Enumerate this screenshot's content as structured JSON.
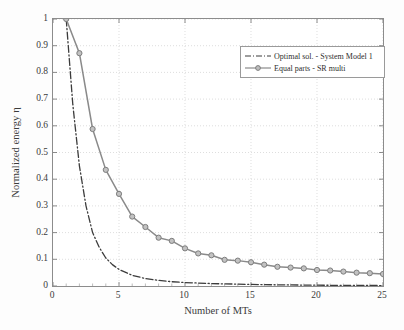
{
  "chart_data": {
    "type": "line",
    "title": "",
    "xlabel": "Number of MTs",
    "ylabel": "Normalized energy η",
    "xlim": [
      0,
      25
    ],
    "ylim": [
      0,
      1
    ],
    "xticks": [
      "0",
      "5",
      "10",
      "15",
      "20",
      "25"
    ],
    "yticks": [
      "0",
      "0.1",
      "0.2",
      "0.3",
      "0.4",
      "0.5",
      "0.6",
      "0.7",
      "0.8",
      "0.9",
      "1"
    ],
    "grid": true,
    "legend_position": "upper right",
    "series": [
      {
        "name": "Optimal sol. - System Model 1",
        "style": "dash-dot",
        "color": "#3c3c3c",
        "marker": "none",
        "x": [
          1,
          1.5,
          2,
          2.5,
          3,
          3.5,
          4,
          4.5,
          5,
          6,
          7,
          8,
          9,
          10,
          11,
          12,
          13,
          14,
          15,
          16,
          17,
          18,
          19,
          20,
          21,
          22,
          23,
          24,
          25
        ],
        "y": [
          1.0,
          0.68,
          0.45,
          0.3,
          0.2,
          0.145,
          0.105,
          0.08,
          0.062,
          0.04,
          0.028,
          0.021,
          0.016,
          0.013,
          0.011,
          0.009,
          0.008,
          0.007,
          0.006,
          0.005,
          0.0045,
          0.004,
          0.0035,
          0.003,
          0.0027,
          0.0024,
          0.0021,
          0.0019,
          0.0017
        ]
      },
      {
        "name": "Equal parts - SR multi",
        "style": "solid",
        "color": "#8a8a8a",
        "marker": "circle",
        "x": [
          1,
          2,
          3,
          4,
          5,
          6,
          7,
          8,
          9,
          10,
          11,
          12,
          13,
          14,
          15,
          16,
          17,
          18,
          19,
          20,
          21,
          22,
          23,
          24,
          25
        ],
        "y": [
          1.0,
          0.872,
          0.588,
          0.435,
          0.345,
          0.26,
          0.221,
          0.181,
          0.169,
          0.141,
          0.122,
          0.115,
          0.098,
          0.095,
          0.089,
          0.08,
          0.072,
          0.069,
          0.066,
          0.06,
          0.058,
          0.054,
          0.05,
          0.048,
          0.045
        ]
      }
    ]
  },
  "legend": {
    "items": [
      {
        "label": "Optimal sol. - System Model 1"
      },
      {
        "label": "Equal parts - SR multi"
      }
    ]
  }
}
